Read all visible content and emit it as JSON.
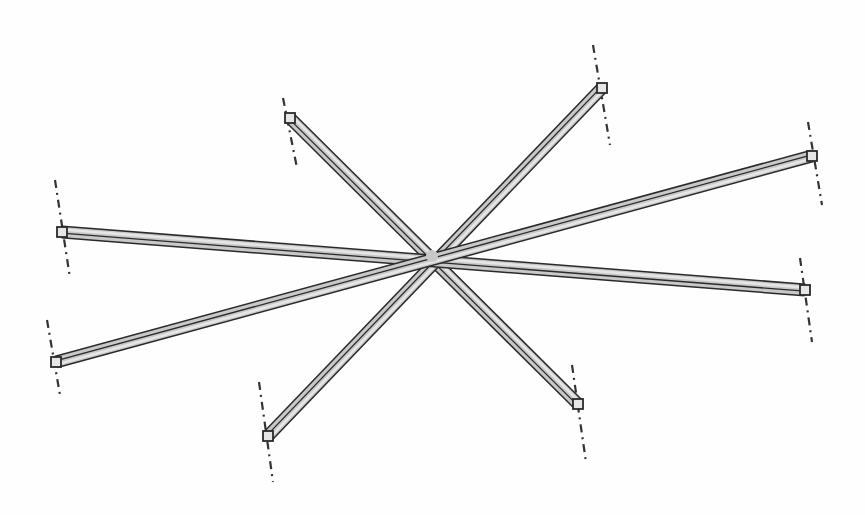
{
  "diagram": {
    "title": "",
    "colors": {
      "background": "#fefefe",
      "beam_fill": "#c8c8c8",
      "beam_edge": "#2a2a2a",
      "beam_highlight": "#e6e6e6",
      "axis_line": "#333333"
    },
    "center": [
      432,
      256
    ],
    "beams": [
      {
        "id": "beam-a",
        "from": [
          290,
          118
        ],
        "to": [
          578,
          404
        ]
      },
      {
        "id": "beam-b",
        "from": [
          602,
          88
        ],
        "to": [
          268,
          436
        ]
      },
      {
        "id": "beam-c",
        "from": [
          62,
          232
        ],
        "to": [
          805,
          290
        ]
      },
      {
        "id": "beam-d",
        "from": [
          812,
          156
        ],
        "to": [
          56,
          362
        ]
      }
    ],
    "axis_lines": [
      {
        "id": "axis-a1",
        "x1": 283,
        "y1": 98,
        "x2": 297,
        "y2": 168
      },
      {
        "id": "axis-a2",
        "x1": 572,
        "y1": 365,
        "x2": 586,
        "y2": 462
      },
      {
        "id": "axis-b1",
        "x1": 593,
        "y1": 45,
        "x2": 610,
        "y2": 145
      },
      {
        "id": "axis-b2",
        "x1": 259,
        "y1": 382,
        "x2": 273,
        "y2": 482
      },
      {
        "id": "axis-c1",
        "x1": 55,
        "y1": 180,
        "x2": 70,
        "y2": 278
      },
      {
        "id": "axis-c2",
        "x1": 800,
        "y1": 258,
        "x2": 812,
        "y2": 342
      },
      {
        "id": "axis-d1",
        "x1": 808,
        "y1": 122,
        "x2": 822,
        "y2": 205
      },
      {
        "id": "axis-d2",
        "x1": 47,
        "y1": 320,
        "x2": 60,
        "y2": 395
      }
    ]
  }
}
